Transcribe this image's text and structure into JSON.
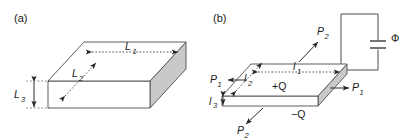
{
  "figure": {
    "background_color": "#ffffff",
    "line_color": "#4d4d4d",
    "text_color": "#1a1a1a",
    "shade_color": "#c8c8c8",
    "width": 418,
    "height": 140
  },
  "panels": [
    {
      "id": "a",
      "label": "(a)",
      "description": "dielectric slab with edge dimensions",
      "dimension_labels": [
        {
          "name": "length-1",
          "text": "L",
          "subscript": "1",
          "italic": true
        },
        {
          "name": "length-2",
          "text": "L",
          "subscript": "2",
          "italic": true
        },
        {
          "name": "length-3",
          "text": "L",
          "subscript": "3",
          "italic": true
        }
      ]
    },
    {
      "id": "b",
      "label": "(b)",
      "description": "charged slab capacitor connected to circuit with potential",
      "dimension_labels": [
        {
          "name": "length-1",
          "text": "l",
          "subscript": "1",
          "italic": true
        },
        {
          "name": "length-2",
          "text": "l",
          "subscript": "2",
          "italic": true
        },
        {
          "name": "length-3",
          "text": "l",
          "subscript": "3",
          "italic": true
        }
      ],
      "polarization_labels": [
        {
          "name": "polarization-p1-left",
          "text": "P",
          "subscript": "1",
          "direction": "left"
        },
        {
          "name": "polarization-p1-right",
          "text": "P",
          "subscript": "1",
          "direction": "right"
        },
        {
          "name": "polarization-p2-top",
          "text": "P",
          "subscript": "2",
          "direction": "up-right"
        },
        {
          "name": "polarization-p2-bottom",
          "text": "P",
          "subscript": "2",
          "direction": "down-left"
        }
      ],
      "charge_labels": [
        {
          "name": "charge-positive",
          "text": "+Q"
        },
        {
          "name": "charge-negative",
          "text": "−Q"
        }
      ],
      "circuit": {
        "potential_label": "Φ",
        "component": "capacitor"
      }
    }
  ]
}
